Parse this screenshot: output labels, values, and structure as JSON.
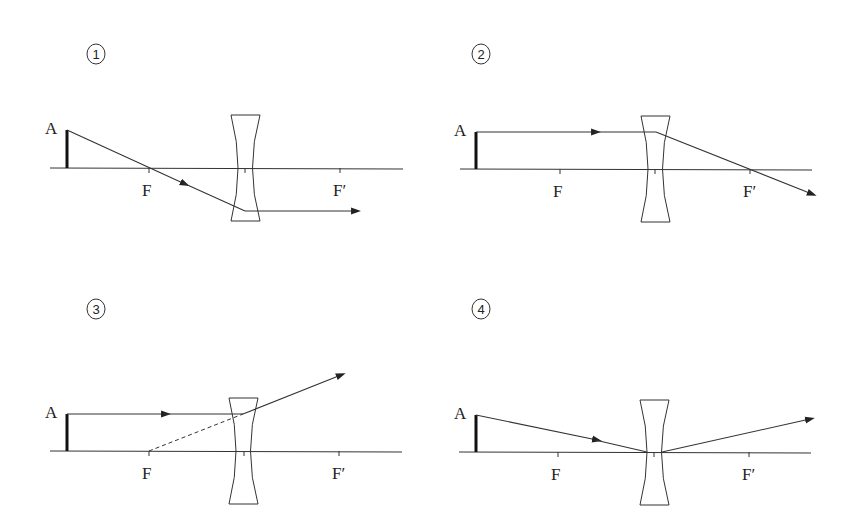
{
  "diagram": {
    "type": "ray-diagram",
    "colors": {
      "line": "#333333",
      "background": "#ffffff"
    },
    "panels": [
      {
        "id": "1",
        "number_label": "1",
        "object_label": "A",
        "focus_left_label": "F",
        "focus_right_label": "F′",
        "ray_description": "Ray from A through F, then parallel to axis after lens"
      },
      {
        "id": "2",
        "number_label": "2",
        "object_label": "A",
        "focus_left_label": "F",
        "focus_right_label": "F′",
        "ray_description": "Ray parallel to axis, then passes through F′ after lens"
      },
      {
        "id": "3",
        "number_label": "3",
        "object_label": "A",
        "focus_left_label": "F",
        "focus_right_label": "F′",
        "ray_description": "Ray parallel to axis, diverges as if from F (dashed extension)"
      },
      {
        "id": "4",
        "number_label": "4",
        "object_label": "A",
        "focus_left_label": "F",
        "focus_right_label": "F′",
        "ray_description": "Ray toward lens center, emerges deflected upward"
      }
    ]
  }
}
